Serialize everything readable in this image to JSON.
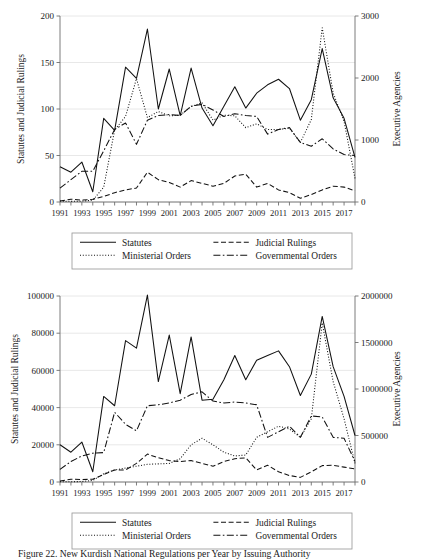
{
  "figure": {
    "caption": "Figure 22. New Kurdish National Regulations per Year by Issuing Authority",
    "caption_visible_fragment": "Figure 22. New Kurdish National Regulations per Year by Issuing Authority"
  },
  "legend": {
    "items": [
      {
        "label": "Statutes",
        "style": "solid",
        "key": "statutes"
      },
      {
        "label": "Judicial Rulings",
        "style": "dashed",
        "key": "judicial"
      },
      {
        "label": "Ministerial Orders",
        "style": "dotted",
        "key": "ministerial"
      },
      {
        "label": "Governmental Orders",
        "style": "dash-dot",
        "key": "governmental"
      }
    ]
  },
  "chart_data": [
    {
      "id": "top-chart",
      "type": "line",
      "title": "",
      "xlabel": "",
      "ylabel": "Statutes and Judicial Rulings",
      "y2label": "Executive Agencies",
      "grid": true,
      "legend_position": "below",
      "x": [
        1991,
        1992,
        1993,
        1994,
        1995,
        1996,
        1997,
        1998,
        1999,
        2000,
        2001,
        2002,
        2003,
        2004,
        2005,
        2006,
        2007,
        2008,
        2009,
        2010,
        2011,
        2012,
        2013,
        2014,
        2015,
        2016,
        2017,
        2018
      ],
      "xtick_labels": [
        "1991",
        "1993",
        "1995",
        "1997",
        "1999",
        "2001",
        "2003",
        "2005",
        "2007",
        "2009",
        "2011",
        "2013",
        "2015",
        "2017"
      ],
      "ylim": [
        0,
        200
      ],
      "yticks": [
        0,
        50,
        100,
        150,
        200
      ],
      "ytick_labels": [
        "0",
        "50",
        "100",
        "150",
        "200"
      ],
      "y2lim": [
        0,
        3000
      ],
      "y2ticks": [
        0,
        1000,
        2000,
        3000
      ],
      "y2tick_labels": [
        "0",
        "1000",
        "2000",
        "3000"
      ],
      "series": [
        {
          "name": "Statutes",
          "axis": "left",
          "style": "solid",
          "values": [
            38,
            32,
            43,
            11,
            90,
            77,
            145,
            133,
            186,
            100,
            143,
            93,
            144,
            101,
            82,
            103,
            124,
            101,
            117,
            126,
            132,
            122,
            88,
            110,
            165,
            112,
            90,
            48
          ]
        },
        {
          "name": "Judicial Rulings",
          "axis": "left",
          "style": "dashed",
          "values": [
            1,
            3,
            2,
            3,
            6,
            10,
            13,
            15,
            32,
            24,
            21,
            16,
            23,
            20,
            17,
            20,
            28,
            30,
            16,
            20,
            13,
            10,
            4,
            8,
            13,
            17,
            16,
            12
          ]
        },
        {
          "name": "Ministerial Orders",
          "axis": "right",
          "style": "dotted",
          "values": [
            15,
            10,
            14,
            28,
            238,
            1160,
            1380,
            1990,
            1360,
            1460,
            1390,
            1400,
            1540,
            1600,
            1320,
            1400,
            1390,
            1200,
            1260,
            1170,
            1170,
            1190,
            960,
            1330,
            2810,
            1760,
            1300,
            380
          ]
        },
        {
          "name": "Governmental Orders",
          "axis": "left",
          "style": "dash-dot",
          "values": [
            15,
            24,
            33,
            33,
            55,
            78,
            85,
            62,
            88,
            93,
            94,
            93,
            103,
            105,
            99,
            92,
            95,
            93,
            92,
            73,
            78,
            80,
            64,
            60,
            68,
            57,
            51,
            50
          ]
        }
      ]
    },
    {
      "id": "bottom-chart",
      "type": "line",
      "title": "",
      "xlabel": "",
      "ylabel": "Statutes and Judicial Rulings",
      "y2label": "Executive Agencies",
      "grid": true,
      "legend_position": "below",
      "x": [
        1991,
        1992,
        1993,
        1994,
        1995,
        1996,
        1997,
        1998,
        1999,
        2000,
        2001,
        2002,
        2003,
        2004,
        2005,
        2006,
        2007,
        2008,
        2009,
        2010,
        2011,
        2012,
        2013,
        2014,
        2015,
        2016,
        2017,
        2018
      ],
      "xtick_labels": [
        "1991",
        "1993",
        "1995",
        "1997",
        "1999",
        "2001",
        "2003",
        "2005",
        "2007",
        "2009",
        "2011",
        "2013",
        "2015",
        "2017"
      ],
      "ylim": [
        0,
        100000
      ],
      "yticks": [
        0,
        20000,
        40000,
        60000,
        80000,
        100000
      ],
      "ytick_labels": [
        "0",
        "20000",
        "40000",
        "60000",
        "80000",
        "100000"
      ],
      "y2lim": [
        0,
        2000000
      ],
      "y2ticks": [
        0,
        500000,
        1000000,
        1500000,
        2000000
      ],
      "y2tick_labels": [
        "0",
        "500000",
        "1000000",
        "1500000",
        "2000000"
      ],
      "series": [
        {
          "name": "Statutes",
          "axis": "left",
          "style": "solid",
          "values": [
            20000,
            16000,
            21500,
            5500,
            46000,
            41000,
            76000,
            72000,
            100500,
            54000,
            79000,
            47500,
            78000,
            44000,
            44500,
            55000,
            68000,
            55000,
            65500,
            68000,
            70500,
            62000,
            46500,
            58000,
            89000,
            62000,
            46000,
            25000
          ]
        },
        {
          "name": "Judicial Rulings",
          "axis": "left",
          "style": "dashed",
          "values": [
            500,
            1500,
            1300,
            1500,
            4000,
            6500,
            6500,
            10000,
            15000,
            13000,
            11500,
            11000,
            11500,
            10000,
            8500,
            11000,
            12500,
            13000,
            6500,
            9000,
            5500,
            3500,
            2500,
            5500,
            8800,
            9000,
            8000,
            7000
          ]
        },
        {
          "name": "Ministerial Orders",
          "axis": "right",
          "style": "dotted",
          "values": [
            2000,
            3000,
            5000,
            17000,
            88000,
            130000,
            150000,
            170000,
            190000,
            195000,
            200000,
            250000,
            400000,
            470000,
            400000,
            320000,
            280000,
            290000,
            480000,
            540000,
            600000,
            570000,
            480000,
            680000,
            1710000,
            1080000,
            680000,
            200000
          ]
        },
        {
          "name": "Governmental Orders",
          "axis": "left",
          "style": "dash-dot",
          "values": [
            6800,
            11000,
            14000,
            15500,
            15800,
            37500,
            31000,
            27500,
            41000,
            41500,
            42500,
            44000,
            47000,
            48500,
            43500,
            42500,
            43000,
            42500,
            41500,
            24000,
            27000,
            30000,
            24000,
            35500,
            35000,
            24000,
            23500,
            11000
          ]
        }
      ]
    }
  ]
}
